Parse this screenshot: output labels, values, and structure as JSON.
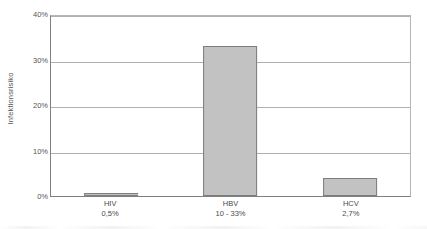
{
  "chart_data": {
    "type": "bar",
    "title": "",
    "xlabel": "",
    "ylabel": "Infektionsrisiko",
    "categories": [
      "HIV",
      "HBV",
      "HCV"
    ],
    "category_values": [
      "0,5%",
      "10 - 33%",
      "2,7%"
    ],
    "values": [
      0.5,
      33,
      4
    ],
    "ylim": [
      0,
      40
    ],
    "ytick_labels": [
      "0%",
      "10%",
      "20%",
      "30%",
      "40%"
    ],
    "ytick_values": [
      0,
      10,
      20,
      30,
      40
    ],
    "grid": "horizontal",
    "legend": "none",
    "series": [
      {
        "name": "Infektionsrisiko",
        "values": [
          0.5,
          33,
          4
        ]
      }
    ],
    "colors": {
      "bar_fill": "#c2c2c2",
      "bar_border": "#7d7d7d",
      "gridline": "#b0b0b0",
      "axis": "#808080",
      "text": "#4a4a4a",
      "background": "#ffffff"
    }
  }
}
